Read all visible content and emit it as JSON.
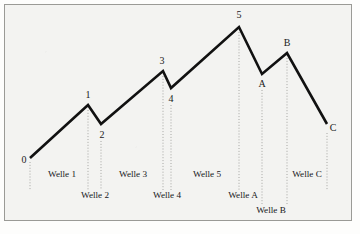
{
  "figure": {
    "kind": "elliott-wave-diagram",
    "background_color": "#f3f3f1",
    "frame_color": "#9a9a96",
    "line_color": "#111111",
    "guide_color": "#9d9d9a"
  },
  "chart_data": {
    "type": "line",
    "title": "",
    "subtitle": "",
    "xlabel": "",
    "ylabel": "",
    "grid": false,
    "legend_position": "none",
    "xlim": [
      0,
      360
    ],
    "ylim": [
      234,
      0
    ],
    "series": [
      {
        "name": "Elliott Wave Pattern",
        "points": [
          {
            "label": "0",
            "x": 30,
            "y": 158
          },
          {
            "label": "1",
            "x": 88,
            "y": 105
          },
          {
            "label": "2",
            "x": 101,
            "y": 124
          },
          {
            "label": "3",
            "x": 163,
            "y": 71
          },
          {
            "label": "4",
            "x": 171,
            "y": 88
          },
          {
            "label": "5",
            "x": 239,
            "y": 27
          },
          {
            "label": "A",
            "x": 262,
            "y": 74
          },
          {
            "label": "B",
            "x": 287,
            "y": 53
          },
          {
            "label": "C",
            "x": 327,
            "y": 124
          }
        ]
      }
    ],
    "point_labels": [
      {
        "text": "0",
        "x": 24,
        "y": 160
      },
      {
        "text": "1",
        "x": 88,
        "y": 95
      },
      {
        "text": "2",
        "x": 102,
        "y": 135
      },
      {
        "text": "3",
        "x": 162,
        "y": 61
      },
      {
        "text": "4",
        "x": 171,
        "y": 99
      },
      {
        "text": "5",
        "x": 239,
        "y": 15
      },
      {
        "text": "A",
        "x": 262,
        "y": 84
      },
      {
        "text": "B",
        "x": 287,
        "y": 43
      },
      {
        "text": "C",
        "x": 333,
        "y": 128
      }
    ],
    "guide_lines": [
      {
        "from_label": "0",
        "x": 30,
        "y_top": 162,
        "y_bottom": 190
      },
      {
        "from_label": "1",
        "x": 88,
        "y_top": 110,
        "y_bottom": 190
      },
      {
        "from_label": "2",
        "x": 101,
        "y_top": 141,
        "y_bottom": 190
      },
      {
        "from_label": "3",
        "x": 163,
        "y_top": 76,
        "y_bottom": 190
      },
      {
        "from_label": "4",
        "x": 171,
        "y_top": 105,
        "y_bottom": 190
      },
      {
        "from_label": "5",
        "x": 239,
        "y_top": 32,
        "y_bottom": 190
      },
      {
        "from_label": "A",
        "x": 262,
        "y_top": 90,
        "y_bottom": 204
      },
      {
        "from_label": "B",
        "x": 287,
        "y_top": 58,
        "y_bottom": 204
      },
      {
        "from_label": "C",
        "x": 327,
        "y_top": 133,
        "y_bottom": 190
      }
    ],
    "wave_labels": [
      {
        "text": "Welle 1",
        "x": 62,
        "y": 175,
        "row": 1
      },
      {
        "text": "Welle 2",
        "x": 95,
        "y": 196,
        "row": 2
      },
      {
        "text": "Welle 3",
        "x": 133,
        "y": 175,
        "row": 1
      },
      {
        "text": "Welle 4",
        "x": 167,
        "y": 196,
        "row": 2
      },
      {
        "text": "Welle 5",
        "x": 207,
        "y": 175,
        "row": 1
      },
      {
        "text": "Welle A",
        "x": 243,
        "y": 196,
        "row": 2
      },
      {
        "text": "Welle B",
        "x": 271,
        "y": 211,
        "row": 3
      },
      {
        "text": "Welle C",
        "x": 307,
        "y": 175,
        "row": 1
      }
    ]
  }
}
